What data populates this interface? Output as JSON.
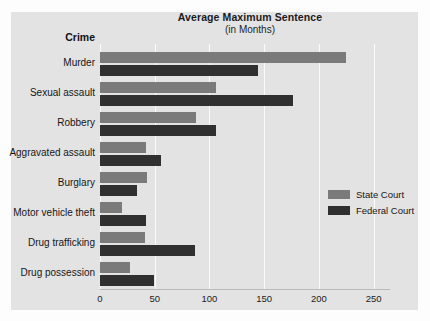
{
  "chart_data": {
    "type": "bar",
    "orientation": "horizontal",
    "title": "Average Maximum Sentence",
    "subtitle": "(in Months)",
    "category_axis_title": "Crime",
    "xlabel": "",
    "ylabel": "",
    "xlim": [
      0,
      265
    ],
    "ticks": [
      0,
      50,
      100,
      150,
      200,
      250
    ],
    "tick_labels": [
      "0",
      "50",
      "100",
      "150",
      "200",
      "250"
    ],
    "grid": true,
    "legend_position": "middle-right",
    "categories": [
      "Murder",
      "Sexual assault",
      "Robbery",
      "Aggravated assault",
      "Burglary",
      "Motor vehicle theft",
      "Drug trafficking",
      "Drug possession"
    ],
    "series": [
      {
        "name": "State Court",
        "color": "#7a7a7a",
        "values": [
          225,
          106,
          88,
          42,
          43,
          20,
          41,
          27
        ]
      },
      {
        "name": "Federal Court",
        "color": "#303030",
        "values": [
          144,
          176,
          106,
          56,
          34,
          42,
          87,
          49
        ]
      }
    ]
  }
}
